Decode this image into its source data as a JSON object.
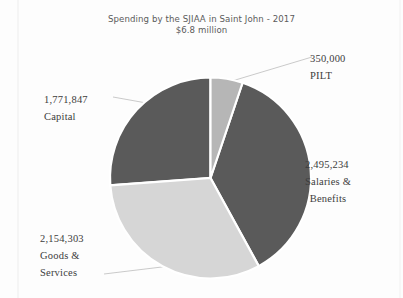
{
  "chart_data": {
    "type": "pie",
    "title": "Spending by the SJIAA in Saint John - 2017",
    "subtitle": "$6.8 million",
    "xlabel": "",
    "ylabel": "",
    "grid": false,
    "legend_position": "none",
    "label_style": "callout-leader-lines",
    "total": 6771384,
    "total_display": "$6.8 million",
    "start_angle_deg": 0,
    "direction": "clockwise",
    "categories": [
      "PILT",
      "Salaries & Benefits",
      "Goods & Services",
      "Capital"
    ],
    "values": [
      350000,
      2495234,
      2154303,
      1771847
    ],
    "value_labels": [
      "350,000",
      "2,495,234",
      "2,154,303",
      "1,771,847"
    ],
    "colors": [
      "#b6b6b6",
      "#5a5a5a",
      "#d6d6d6",
      "#5a5a5a"
    ],
    "slices": [
      {
        "name": "PILT",
        "value": 350000,
        "value_label": "350,000",
        "label_lines": [
          "350,000",
          "PILT"
        ],
        "color": "#b6b6b6",
        "start_deg": 0,
        "end_deg": 18.61,
        "percent": 5.2
      },
      {
        "name": "Salaries & Benefits",
        "value": 2495234,
        "value_label": "2,495,234",
        "label_lines": [
          "2,495,234",
          "Salaries &",
          "Benefits"
        ],
        "color": "#5a5a5a",
        "start_deg": 18.61,
        "end_deg": 151.29,
        "percent": 36.8
      },
      {
        "name": "Goods & Services",
        "value": 2154303,
        "value_label": "2,154,303",
        "label_lines": [
          "2,154,303",
          "Goods &",
          "Services"
        ],
        "color": "#d6d6d6",
        "start_deg": 151.29,
        "end_deg": 265.83,
        "percent": 31.8
      },
      {
        "name": "Capital",
        "value": 1771847,
        "value_label": "1,771,847",
        "label_lines": [
          "1,771,847",
          "Capital"
        ],
        "color": "#5a5a5a",
        "start_deg": 265.83,
        "end_deg": 360,
        "percent": 26.2
      }
    ]
  },
  "labels": {
    "pilt": {
      "value": "350,000",
      "name": "PILT"
    },
    "capital": {
      "value": "1,771,847",
      "name": "Capital"
    },
    "salaries": {
      "value": "2,495,234",
      "name_line1": "Salaries &",
      "name_line2": "Benefits"
    },
    "goods": {
      "value": "2,154,303",
      "name_line1": "Goods &",
      "name_line2": "Services"
    }
  },
  "style": {
    "background": "#fdfdfd",
    "text_color": "#3c3c3c",
    "title_color": "#5b5b5b",
    "dark_slice": "#5a5a5a",
    "mid_slice": "#b6b6b6",
    "light_slice": "#d6d6d6",
    "separator": "#ffffff",
    "leader_line": "#b9b9b9"
  }
}
